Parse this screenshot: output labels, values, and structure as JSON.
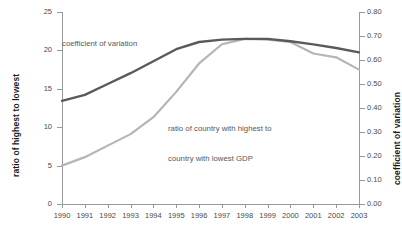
{
  "chart_data": {
    "type": "line",
    "title": "",
    "xlabel": "",
    "x": [
      1990,
      1991,
      1992,
      1993,
      1994,
      1995,
      1996,
      1997,
      1998,
      1999,
      2000,
      2001,
      2002,
      2003
    ],
    "categories": [
      "1990",
      "1991",
      "1992",
      "1993",
      "1994",
      "1995",
      "1996",
      "1997",
      "1998",
      "1999",
      "2000",
      "2001",
      "2002",
      "2003"
    ],
    "grid": false,
    "legend_position": "inline-annotation",
    "axes": {
      "left": {
        "label": "ratio of highest to lowest",
        "ticks": [
          "0",
          "5",
          "10",
          "15",
          "20",
          "25"
        ],
        "tick_values": [
          0,
          5,
          10,
          15,
          20,
          25
        ],
        "ylim": [
          0,
          25
        ]
      },
      "right": {
        "label": "coefficient of variation",
        "ticks": [
          "0.00",
          "0.10",
          "0.20",
          "0.30",
          "0.40",
          "0.50",
          "0.60",
          "0.70",
          "0.80"
        ],
        "tick_values": [
          0.0,
          0.1,
          0.2,
          0.3,
          0.4,
          0.5,
          0.6,
          0.7,
          0.8
        ],
        "ylim": [
          0.0,
          0.8
        ]
      }
    },
    "series": [
      {
        "name": "coefficient of variation",
        "axis": "right",
        "color": "#5a5a5a",
        "annotation": "coefficient of variation",
        "values": [
          0.43,
          0.455,
          0.5,
          0.545,
          0.595,
          0.645,
          0.675,
          0.685,
          0.688,
          0.688,
          0.678,
          0.665,
          0.65,
          0.632
        ]
      },
      {
        "name": "ratio of country with highest to country with lowest GDP",
        "axis": "left",
        "color": "#b5b5b5",
        "annotation": "ratio of country with highest to\ncountry with lowest GDP",
        "values": [
          5.0,
          6.1,
          7.6,
          9.1,
          11.3,
          14.6,
          18.3,
          20.8,
          21.5,
          21.4,
          21.1,
          19.6,
          19.1,
          17.5
        ]
      }
    ]
  },
  "annotations": {
    "coefficient_of_variation": "coefficient of variation",
    "ratio_line1": "ratio of country with highest to",
    "ratio_line2": "country with lowest GDP"
  }
}
